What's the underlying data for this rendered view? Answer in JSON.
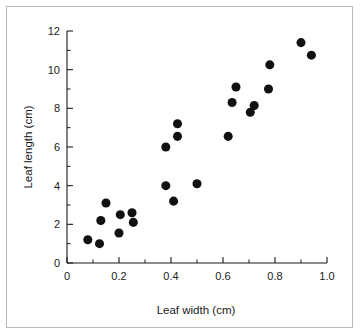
{
  "figure": {
    "background_color": "#ffffff",
    "border_color": "#b9b9b9",
    "point_color": "#111111",
    "axis_color": "#1a1a1a"
  },
  "chart_data": {
    "type": "scatter",
    "title": "",
    "xlabel": "Leaf width (cm)",
    "ylabel": "Leaf length (cm)",
    "xlim": [
      0,
      1.0
    ],
    "ylim": [
      0,
      12
    ],
    "xticks": [
      0,
      0.2,
      0.4,
      0.6,
      0.8,
      1.0
    ],
    "xtick_labels": [
      "0",
      "0.2",
      "0.4",
      "0.6",
      "0.8",
      "1.0"
    ],
    "yticks": [
      0,
      2,
      4,
      6,
      8,
      10,
      12
    ],
    "ytick_labels": [
      "0",
      "2",
      "4",
      "6",
      "8",
      "10",
      "12"
    ],
    "x_minor_ticks": [
      0.1,
      0.3,
      0.5,
      0.7,
      0.9
    ],
    "y_minor_ticks": [
      1,
      3,
      5,
      7,
      9,
      11
    ],
    "grid": false,
    "legend": false,
    "marker": "circle",
    "marker_size": 5,
    "points": [
      {
        "x": 0.08,
        "y": 1.2
      },
      {
        "x": 0.125,
        "y": 1.0
      },
      {
        "x": 0.13,
        "y": 2.2
      },
      {
        "x": 0.15,
        "y": 3.1
      },
      {
        "x": 0.2,
        "y": 1.55
      },
      {
        "x": 0.205,
        "y": 2.5
      },
      {
        "x": 0.25,
        "y": 2.6
      },
      {
        "x": 0.255,
        "y": 2.1
      },
      {
        "x": 0.38,
        "y": 4.0
      },
      {
        "x": 0.38,
        "y": 6.0
      },
      {
        "x": 0.41,
        "y": 3.2
      },
      {
        "x": 0.425,
        "y": 6.55
      },
      {
        "x": 0.425,
        "y": 7.2
      },
      {
        "x": 0.5,
        "y": 4.1
      },
      {
        "x": 0.62,
        "y": 6.55
      },
      {
        "x": 0.635,
        "y": 8.3
      },
      {
        "x": 0.65,
        "y": 9.1
      },
      {
        "x": 0.705,
        "y": 7.8
      },
      {
        "x": 0.72,
        "y": 8.15
      },
      {
        "x": 0.775,
        "y": 9.0
      },
      {
        "x": 0.78,
        "y": 10.25
      },
      {
        "x": 0.9,
        "y": 11.4
      },
      {
        "x": 0.94,
        "y": 10.75
      }
    ]
  }
}
